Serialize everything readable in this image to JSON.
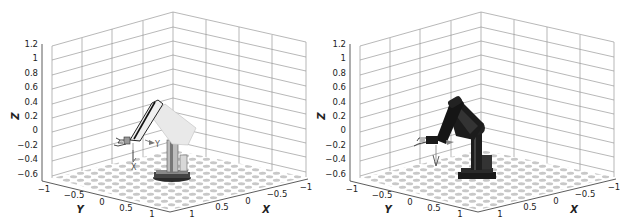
{
  "figure": {
    "panels": [
      {
        "id": "left",
        "robot_style": "transparent-light",
        "z_axis": {
          "label": "Z",
          "ticks": [
            "1.2",
            "1",
            "0.8",
            "0.6",
            "0.4",
            "0.2",
            "0",
            "−0.2",
            "−0.4",
            "−0.6"
          ]
        },
        "y_axis": {
          "label": "Y",
          "ticks": [
            "−1",
            "−0.5",
            "0",
            "0.5",
            "1"
          ]
        },
        "x_axis": {
          "label": "X",
          "ticks": [
            "1",
            "0.5",
            "0",
            "−0.5",
            "−1"
          ]
        },
        "frame_labels": {
          "y": "Y",
          "x": "X"
        }
      },
      {
        "id": "right",
        "robot_style": "solid-dark",
        "z_axis": {
          "label": "Z",
          "ticks": [
            "1.2",
            "1",
            "0.8",
            "0.6",
            "0.4",
            "0.2",
            "0",
            "−0.2",
            "−0.4",
            "−0.6"
          ]
        },
        "y_axis": {
          "label": "Y",
          "ticks": [
            "−1",
            "−0.5",
            "0",
            "0.5",
            "1"
          ]
        },
        "x_axis": {
          "label": "X",
          "ticks": [
            "1",
            "0.5",
            "0",
            "−0.5",
            "−1"
          ]
        },
        "frame_labels": {
          "y": "",
          "x": ""
        }
      }
    ],
    "colors": {
      "grid": "#9a9a9a",
      "axis": "#333333",
      "floor_checker": "#c8c8c8",
      "robot_light": "#e6e6e6",
      "robot_dark": "#1c1c1c"
    }
  }
}
